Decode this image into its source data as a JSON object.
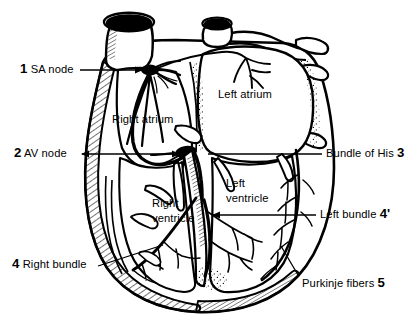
{
  "figure": {
    "background_color": "#ffffff",
    "ink_color": "#000000",
    "width": 418,
    "height": 332
  },
  "numbered_callouts": [
    {
      "id": "sa-node",
      "number": "1",
      "label": "SA node",
      "number_side": "left",
      "text": "SA node"
    },
    {
      "id": "av-node",
      "number": "2",
      "label": "AV node",
      "number_side": "left",
      "text": "AV node"
    },
    {
      "id": "bundle-of-his",
      "number": "3",
      "label": "Bundle of His",
      "number_side": "right",
      "text": "Bundle of His"
    },
    {
      "id": "right-bundle",
      "number": "4",
      "label": "Right bundle",
      "number_side": "left",
      "text": "Right bundle"
    },
    {
      "id": "left-bundle",
      "number": "4'",
      "label": "Left bundle",
      "number_side": "right",
      "text": "Left bundle"
    },
    {
      "id": "purkinje-fibers",
      "number": "5",
      "label": "Purkinje fibers",
      "number_side": "right",
      "text": "Purkinje fibers"
    }
  ],
  "chamber_labels": [
    {
      "id": "right-atrium",
      "text": "Right atrium",
      "lines": [
        "Right atrium"
      ]
    },
    {
      "id": "left-atrium",
      "text": "Left atrium",
      "lines": [
        "Left atrium"
      ]
    },
    {
      "id": "right-ventricle",
      "text": "Right ventricle",
      "line1": "Right",
      "line2": "ventricle"
    },
    {
      "id": "left-ventricle",
      "text": "Left ventricle",
      "line1": "Left",
      "line2": "ventricle"
    }
  ]
}
